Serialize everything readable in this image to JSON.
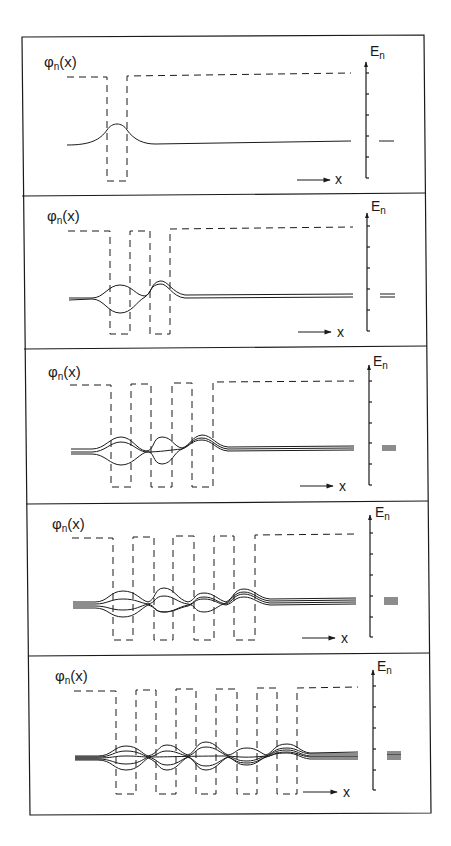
{
  "figure": {
    "colors": {
      "ink": "#1a1a1a",
      "background": "#ffffff"
    },
    "panels": [
      {
        "wells": 1,
        "psi_label": "φ",
        "psi_sub": "n",
        "psi_arg": "(x)",
        "energy_label": "E",
        "energy_sub": "n",
        "x_label": "x",
        "energy_levels": 1
      },
      {
        "wells": 2,
        "psi_label": "φ",
        "psi_sub": "n",
        "psi_arg": "(x)",
        "energy_label": "E",
        "energy_sub": "n",
        "x_label": "x",
        "energy_levels": 2
      },
      {
        "wells": 3,
        "psi_label": "φ",
        "psi_sub": "n",
        "psi_arg": "(x)",
        "energy_label": "E",
        "energy_sub": "n",
        "x_label": "x",
        "energy_levels": 3
      },
      {
        "wells": 4,
        "psi_label": "φ",
        "psi_sub": "n",
        "psi_arg": "(x)",
        "energy_label": "E",
        "energy_sub": "n",
        "x_label": "x",
        "energy_levels": 4
      },
      {
        "wells": 5,
        "psi_label": "φ",
        "psi_sub": "n",
        "psi_arg": "(x)",
        "energy_label": "E",
        "energy_sub": "n",
        "x_label": "x",
        "energy_levels": 5
      }
    ]
  }
}
